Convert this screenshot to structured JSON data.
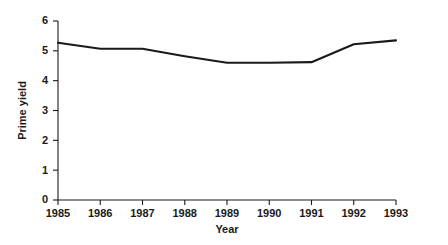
{
  "chart_data": {
    "type": "line",
    "title": "",
    "xlabel": "Year",
    "ylabel": "Prime yield",
    "x": [
      1985,
      1986,
      1987,
      1988,
      1989,
      1990,
      1991,
      1992,
      1993
    ],
    "categories": [
      "1985",
      "1986",
      "1987",
      "1988",
      "1989",
      "1990",
      "1991",
      "1992",
      "1993"
    ],
    "values": [
      5.27,
      5.07,
      5.07,
      4.82,
      4.6,
      4.6,
      4.62,
      5.22,
      5.35
    ],
    "series": [
      {
        "name": "Prime yield",
        "values": [
          5.27,
          5.07,
          5.07,
          4.82,
          4.6,
          4.6,
          4.62,
          5.22,
          5.35
        ]
      }
    ],
    "xlim": [
      1985,
      1993
    ],
    "ylim": [
      0,
      6
    ],
    "yticks": [
      0,
      1,
      2,
      3,
      4,
      5,
      6
    ],
    "yticklabels": [
      "0",
      "1",
      "2",
      "3",
      "4",
      "5",
      "6"
    ],
    "xticks": [
      1985,
      1986,
      1987,
      1988,
      1989,
      1990,
      1991,
      1992,
      1993
    ],
    "xticklabels": [
      "1985",
      "1986",
      "1987",
      "1988",
      "1989",
      "1990",
      "1991",
      "1992",
      "1993"
    ],
    "grid": false,
    "legend": false,
    "line_color": "#1a1a1a",
    "background_color": "#ffffff"
  }
}
